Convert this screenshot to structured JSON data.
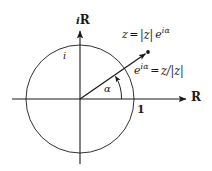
{
  "figure": {
    "name": "complex-unit-circle-diagram",
    "background_color": "#ffffff",
    "stroke_color": "#1a1a1a",
    "axes": {
      "imaginary_label": "iR",
      "imaginary_label_italic_part": "i",
      "imaginary_label_bold_part": "R",
      "real_label": "R"
    },
    "marks": {
      "unit_imaginary_label": "i",
      "unit_real_label": "1",
      "angle_label": "α"
    },
    "annotations": [
      {
        "id": "z-polar-form",
        "parts": {
          "lhs": "z",
          "equals": "=",
          "modulus": "|z|",
          "exponential_base": "e",
          "exponent": "iα"
        },
        "plain": "z = |z| e^{iα}"
      },
      {
        "id": "unit-direction",
        "parts": {
          "exponential_base": "e",
          "exponent": "iα",
          "equals": "=",
          "rhs": "z/|z|"
        },
        "plain": "e^{iα} = z/|z|"
      }
    ],
    "geometry": {
      "center_x": 80,
      "center_y": 99,
      "radius": 54,
      "ray_angle_degrees": 34.6,
      "point_x": 148,
      "point_y": 52
    }
  }
}
